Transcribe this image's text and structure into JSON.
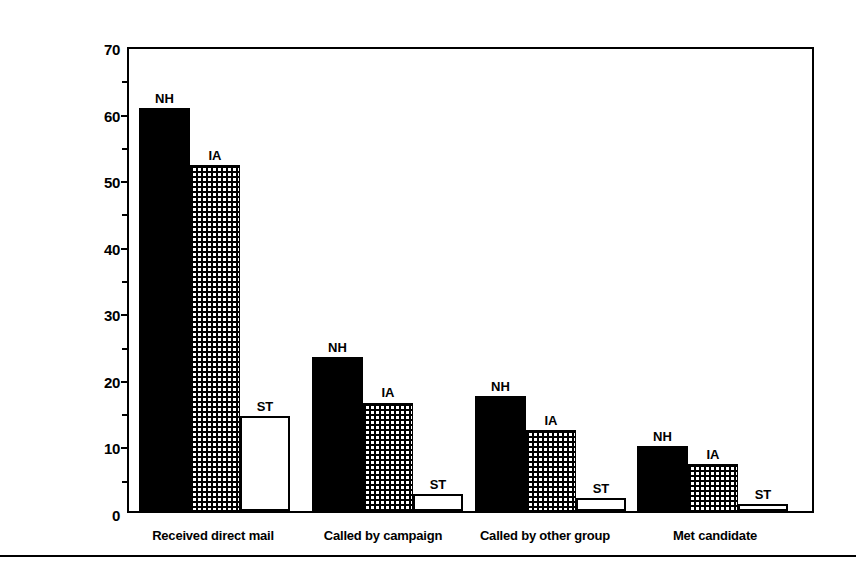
{
  "chart_data": {
    "type": "bar",
    "title": "",
    "subtitle": "",
    "xlabel": "",
    "ylabel": "Percent of residents",
    "ylim": [
      0,
      70
    ],
    "ytick_values": [
      0,
      10,
      20,
      30,
      40,
      50,
      60,
      70
    ],
    "ytick_labels": [
      "0",
      "10",
      "20",
      "30",
      "40",
      "50",
      "60",
      "70"
    ],
    "yminor_values": [
      5,
      15,
      25,
      35,
      45,
      55,
      65
    ],
    "grid": false,
    "legend_position": "above-bars (direct labels)",
    "categories": [
      "Received direct mail",
      "Called by campaign",
      "Called by other group",
      "Met candidate"
    ],
    "series": [
      {
        "name": "NH",
        "label": "NH",
        "fill": "solid-black",
        "values": [
          60.5,
          23.2,
          17.3,
          9.8
        ]
      },
      {
        "name": "IA",
        "label": "IA",
        "fill": "dotted-grid",
        "values": [
          52.0,
          16.3,
          12.2,
          7.0
        ]
      },
      {
        "name": "ST",
        "label": "ST",
        "fill": "white-outline",
        "values": [
          14.3,
          2.5,
          2.0,
          1.0
        ]
      }
    ],
    "annotations": [
      "NH",
      "IA",
      "ST",
      "NH",
      "IA",
      "ST",
      "NH",
      "IA",
      "ST",
      "NH",
      "IA",
      "ST"
    ]
  },
  "axis": {
    "y_title": "Percent of residents"
  },
  "colors": {
    "axis": "#000000",
    "series_nh": "#000000",
    "series_ia": "#000000",
    "series_st": "#ffffff",
    "background": "#ffffff"
  }
}
